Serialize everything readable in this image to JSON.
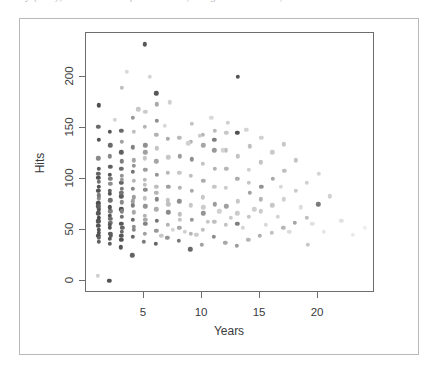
{
  "caption": {
    "text": "y (raw), residuals and fitted values, design matrix rows, etc."
  },
  "chart_data": {
    "type": "scatter",
    "title": "",
    "subtitle": "",
    "xlabel": "Years",
    "ylabel": "Hits",
    "xlim": [
      0,
      24.9
    ],
    "ylim": [
      -12,
      243
    ],
    "xticks": [
      5,
      10,
      15,
      20
    ],
    "yticks": [
      0,
      50,
      100,
      150,
      200
    ],
    "xticklabels": [
      "5",
      "10",
      "15",
      "20"
    ],
    "yticklabels": [
      "0",
      "50",
      "100",
      "150",
      "200"
    ],
    "grid": false,
    "legend": null,
    "marker": "filled-circle",
    "marker_size_px": 4.4,
    "point_color_encoding": "grayscale-varying",
    "colors": {
      "frame": "#6d6d6d",
      "outer_frame": "#b9b9b9",
      "text": "#3a3a3a",
      "point_dark": "#333333",
      "point_mid": "#808080",
      "point_light": "#cfcfcf",
      "background": "#ffffff"
    },
    "n_points": 232,
    "points": [
      [
        1,
        5,
        0.22
      ],
      [
        1.05,
        66,
        0.78
      ],
      [
        1.1,
        81,
        0.52
      ],
      [
        1.05,
        76,
        0.83
      ],
      [
        1.1,
        92,
        0.8
      ],
      [
        1.05,
        105,
        0.72
      ],
      [
        1.1,
        110,
        0.76
      ],
      [
        1.05,
        120,
        0.55
      ],
      [
        1.1,
        138,
        0.8
      ],
      [
        1.05,
        151,
        0.7
      ],
      [
        1.1,
        172,
        0.82
      ],
      [
        1.05,
        59,
        0.8
      ],
      [
        1.1,
        62,
        0.84
      ],
      [
        1.05,
        54,
        0.8
      ],
      [
        1.1,
        47,
        0.78
      ],
      [
        1.05,
        44,
        0.82
      ],
      [
        1.12,
        38,
        0.74
      ],
      [
        1.05,
        88,
        0.8
      ],
      [
        1.1,
        97,
        0.66
      ],
      [
        1.05,
        101,
        0.8
      ],
      [
        1.1,
        70,
        0.8
      ],
      [
        1.05,
        73,
        0.74
      ],
      [
        1.12,
        84,
        0.62
      ],
      [
        1.05,
        58,
        0.78
      ],
      [
        1.1,
        50,
        0.8
      ],
      [
        1.08,
        42,
        0.72
      ],
      [
        2,
        0,
        0.8
      ],
      [
        2.05,
        41,
        0.78
      ],
      [
        2.1,
        46,
        0.74
      ],
      [
        2.05,
        52,
        0.8
      ],
      [
        2.1,
        57,
        0.64
      ],
      [
        2.05,
        64,
        0.8
      ],
      [
        2.1,
        68,
        0.58
      ],
      [
        2.05,
        72,
        0.8
      ],
      [
        2.1,
        79,
        0.66
      ],
      [
        2.05,
        88,
        0.72
      ],
      [
        2.1,
        95,
        0.52
      ],
      [
        2.05,
        104,
        0.78
      ],
      [
        2.1,
        112,
        0.74
      ],
      [
        2.05,
        122,
        0.56
      ],
      [
        2.1,
        133,
        0.7
      ],
      [
        2.05,
        146,
        0.78
      ],
      [
        2.12,
        44,
        0.76
      ],
      [
        2.05,
        36,
        0.74
      ],
      [
        2.1,
        61,
        0.68
      ],
      [
        2.05,
        85,
        0.8
      ],
      [
        2.1,
        100,
        0.6
      ],
      [
        2.05,
        55,
        0.78
      ],
      [
        3,
        33,
        0.78
      ],
      [
        3.05,
        40,
        0.8
      ],
      [
        3.1,
        48,
        0.7
      ],
      [
        3.05,
        56,
        0.78
      ],
      [
        3.1,
        63,
        0.66
      ],
      [
        3.05,
        70,
        0.8
      ],
      [
        3.1,
        77,
        0.55
      ],
      [
        3.05,
        83,
        0.76
      ],
      [
        3.1,
        90,
        0.62
      ],
      [
        3.05,
        96,
        0.72
      ],
      [
        3.1,
        103,
        0.5
      ],
      [
        3.05,
        110,
        0.68
      ],
      [
        3.1,
        117,
        0.6
      ],
      [
        3.05,
        126,
        0.74
      ],
      [
        3.1,
        136,
        0.44
      ],
      [
        3.05,
        147,
        0.7
      ],
      [
        3.1,
        189,
        0.3
      ],
      [
        3.12,
        52,
        0.72
      ],
      [
        3.05,
        44,
        0.78
      ],
      [
        3.1,
        68,
        0.58
      ],
      [
        3.05,
        86,
        0.64
      ],
      [
        3.1,
        99,
        0.48
      ],
      [
        4,
        25,
        0.72
      ],
      [
        4.05,
        43,
        0.7
      ],
      [
        4.1,
        53,
        0.52
      ],
      [
        4.05,
        60,
        0.68
      ],
      [
        4.1,
        67,
        0.4
      ],
      [
        4.05,
        74,
        0.62
      ],
      [
        4.1,
        82,
        0.46
      ],
      [
        4.05,
        90,
        0.56
      ],
      [
        4.1,
        98,
        0.34
      ],
      [
        4.05,
        107,
        0.64
      ],
      [
        4.1,
        118,
        0.42
      ],
      [
        4.05,
        131,
        0.58
      ],
      [
        4.1,
        146,
        0.3
      ],
      [
        4.05,
        160,
        0.48
      ],
      [
        4.1,
        50,
        0.56
      ],
      [
        4.05,
        78,
        0.44
      ],
      [
        4.1,
        113,
        0.5
      ],
      [
        5,
        38,
        0.62
      ],
      [
        5.05,
        46,
        0.44
      ],
      [
        5.1,
        56,
        0.58
      ],
      [
        5.05,
        64,
        0.36
      ],
      [
        5.1,
        73,
        0.5
      ],
      [
        5.05,
        81,
        0.28
      ],
      [
        5.1,
        89,
        0.54
      ],
      [
        5.05,
        99,
        0.32
      ],
      [
        5.1,
        109,
        0.46
      ],
      [
        5.05,
        120,
        0.26
      ],
      [
        5.1,
        133,
        0.52
      ],
      [
        5.05,
        151,
        0.34
      ],
      [
        5.1,
        166,
        0.24
      ],
      [
        5.05,
        232,
        0.78
      ],
      [
        5.1,
        60,
        0.4
      ],
      [
        5.05,
        94,
        0.3
      ],
      [
        5.1,
        126,
        0.44
      ],
      [
        6,
        36,
        0.72
      ],
      [
        6.05,
        49,
        0.48
      ],
      [
        6.1,
        59,
        0.64
      ],
      [
        6.05,
        70,
        0.38
      ],
      [
        6.1,
        80,
        0.56
      ],
      [
        6.05,
        92,
        0.3
      ],
      [
        6.1,
        104,
        0.5
      ],
      [
        6.05,
        117,
        0.42
      ],
      [
        6.1,
        130,
        0.28
      ],
      [
        6.05,
        143,
        0.36
      ],
      [
        6.1,
        157,
        0.52
      ],
      [
        6.05,
        184,
        0.78
      ],
      [
        6.1,
        173,
        0.4
      ],
      [
        6.05,
        86,
        0.34
      ],
      [
        7,
        42,
        0.5
      ],
      [
        7.05,
        55,
        0.36
      ],
      [
        7.1,
        67,
        0.54
      ],
      [
        7.05,
        79,
        0.28
      ],
      [
        7.1,
        92,
        0.44
      ],
      [
        7.05,
        106,
        0.34
      ],
      [
        7.1,
        121,
        0.26
      ],
      [
        7.05,
        139,
        0.4
      ],
      [
        7.1,
        75,
        0.3
      ],
      [
        8,
        39,
        0.62
      ],
      [
        8.05,
        52,
        0.42
      ],
      [
        8.1,
        65,
        0.3
      ],
      [
        8.05,
        78,
        0.52
      ],
      [
        8.1,
        91,
        0.36
      ],
      [
        8.05,
        106,
        0.26
      ],
      [
        8.1,
        122,
        0.46
      ],
      [
        8.05,
        140,
        0.32
      ],
      [
        8.1,
        60,
        0.28
      ],
      [
        9,
        31,
        0.7
      ],
      [
        9.05,
        46,
        0.34
      ],
      [
        9.1,
        60,
        0.48
      ],
      [
        9.05,
        74,
        0.26
      ],
      [
        9.1,
        88,
        0.4
      ],
      [
        9.05,
        103,
        0.3
      ],
      [
        9.1,
        119,
        0.52
      ],
      [
        9.05,
        136,
        0.36
      ],
      [
        9.1,
        154,
        0.28
      ],
      [
        10,
        35,
        0.44
      ],
      [
        10.05,
        50,
        0.3
      ],
      [
        10.1,
        66,
        0.5
      ],
      [
        10.05,
        82,
        0.26
      ],
      [
        10.1,
        98,
        0.38
      ],
      [
        10.05,
        115,
        0.28
      ],
      [
        10.1,
        133,
        0.42
      ],
      [
        10.05,
        143,
        0.34
      ],
      [
        10.1,
        72,
        0.24
      ],
      [
        11,
        43,
        0.54
      ],
      [
        11.05,
        58,
        0.3
      ],
      [
        11.1,
        75,
        0.46
      ],
      [
        11.05,
        92,
        0.26
      ],
      [
        11.1,
        110,
        0.36
      ],
      [
        11.05,
        128,
        0.48
      ],
      [
        11.1,
        147,
        0.32
      ],
      [
        11.05,
        138,
        0.6
      ],
      [
        12,
        37,
        0.4
      ],
      [
        12.05,
        55,
        0.28
      ],
      [
        12.1,
        73,
        0.44
      ],
      [
        12.05,
        91,
        0.24
      ],
      [
        12.1,
        110,
        0.34
      ],
      [
        12.05,
        128,
        0.3
      ],
      [
        12.1,
        145,
        0.26
      ],
      [
        13,
        34,
        0.46
      ],
      [
        13.05,
        56,
        0.6
      ],
      [
        13.1,
        78,
        0.26
      ],
      [
        13.05,
        100,
        0.38
      ],
      [
        13.1,
        122,
        0.28
      ],
      [
        13.05,
        145,
        0.82
      ],
      [
        13.1,
        200,
        0.8
      ],
      [
        13.05,
        66,
        0.24
      ],
      [
        14,
        40,
        0.34
      ],
      [
        14.05,
        63,
        0.26
      ],
      [
        14.1,
        86,
        0.44
      ],
      [
        14.05,
        109,
        0.22
      ],
      [
        14.1,
        132,
        0.3
      ],
      [
        14.05,
        96,
        0.26
      ],
      [
        15,
        44,
        0.38
      ],
      [
        15.05,
        68,
        0.24
      ],
      [
        15.1,
        92,
        0.5
      ],
      [
        15.05,
        116,
        0.28
      ],
      [
        15.1,
        140,
        0.22
      ],
      [
        15.05,
        80,
        0.34
      ],
      [
        16,
        47,
        0.3
      ],
      [
        16.05,
        74,
        0.26
      ],
      [
        16.1,
        100,
        0.4
      ],
      [
        16.05,
        126,
        0.24
      ],
      [
        17,
        52,
        0.34
      ],
      [
        17.05,
        80,
        0.22
      ],
      [
        17.1,
        108,
        0.3
      ],
      [
        17.05,
        134,
        0.26
      ],
      [
        18,
        57,
        0.42
      ],
      [
        18.05,
        88,
        0.24
      ],
      [
        18.1,
        118,
        0.28
      ],
      [
        19,
        62,
        0.3
      ],
      [
        19.05,
        96,
        0.22
      ],
      [
        19.1,
        35,
        0.26
      ],
      [
        20,
        75,
        0.62
      ],
      [
        20.05,
        105,
        0.2
      ],
      [
        21,
        83,
        0.22
      ],
      [
        22,
        59,
        0.14
      ],
      [
        23,
        45,
        0.1
      ],
      [
        24,
        52,
        0.08
      ],
      [
        12.5,
        62,
        0.24
      ],
      [
        11.5,
        68,
        0.22
      ],
      [
        13.5,
        52,
        0.2
      ],
      [
        10.5,
        58,
        0.26
      ],
      [
        9.5,
        45,
        0.24
      ],
      [
        8.5,
        48,
        0.22
      ],
      [
        7.5,
        50,
        0.2
      ],
      [
        6.5,
        44,
        0.26
      ],
      [
        14.5,
        70,
        0.22
      ],
      [
        15.5,
        55,
        0.18
      ],
      [
        16.5,
        63,
        0.2
      ],
      [
        17.5,
        48,
        0.16
      ],
      [
        5.5,
        200,
        0.2
      ],
      [
        7.2,
        175,
        0.22
      ],
      [
        4.5,
        168,
        0.26
      ],
      [
        6.8,
        152,
        0.18
      ],
      [
        12.2,
        155,
        0.22
      ],
      [
        13.8,
        148,
        0.2
      ],
      [
        10.8,
        160,
        0.18
      ],
      [
        9.8,
        142,
        0.24
      ],
      [
        11.8,
        128,
        0.2
      ],
      [
        8.8,
        135,
        0.22
      ],
      [
        3.5,
        205,
        0.18
      ],
      [
        2.5,
        158,
        0.2
      ],
      [
        16.8,
        92,
        0.18
      ],
      [
        18.5,
        72,
        0.16
      ],
      [
        20.5,
        48,
        0.12
      ],
      [
        19.5,
        56,
        0.14
      ]
    ]
  }
}
